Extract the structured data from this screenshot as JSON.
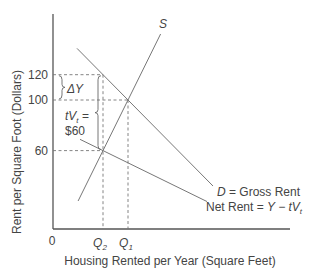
{
  "chart_data": {
    "type": "line",
    "title": "",
    "xlabel": "Housing Rented per Year (Square Feet)",
    "ylabel": "Rent per Square Foot (Dollars)",
    "origin_label": "0",
    "y_ticks": [
      {
        "value": 120,
        "label": "120"
      },
      {
        "value": 100,
        "label": "100"
      },
      {
        "value": 60,
        "label": "60"
      }
    ],
    "x_ticks": [
      {
        "key": "Q2",
        "label": "Q",
        "sub": "2"
      },
      {
        "key": "Q1",
        "label": "Q",
        "sub": "1"
      }
    ],
    "grid": false,
    "series": [
      {
        "name": "S",
        "label": "S",
        "kind": "supply"
      },
      {
        "name": "D",
        "label_italic": "D",
        "label_rest": " = Gross Rent",
        "kind": "demand"
      },
      {
        "name": "Net Rent",
        "label_rest": "Net Rent = ",
        "label_italic": "Y − tV",
        "label_sub": "t",
        "kind": "net-demand"
      }
    ],
    "points": {
      "equilibrium_no_tax": {
        "x": "Q1",
        "y": 100
      },
      "equilibrium_with_tax": {
        "x": "Q2",
        "y": 60
      },
      "gross_rent_at_Q2": {
        "x": "Q2",
        "y": 120
      }
    },
    "annotations": [
      {
        "key": "deltaY",
        "text": "ΔY",
        "spans": [
          100,
          120
        ]
      },
      {
        "key": "tax",
        "line1_italic": "tV",
        "line1_sub": "t",
        "line1_rest": " =",
        "line2": "$60",
        "spans": [
          60,
          120
        ]
      }
    ]
  }
}
